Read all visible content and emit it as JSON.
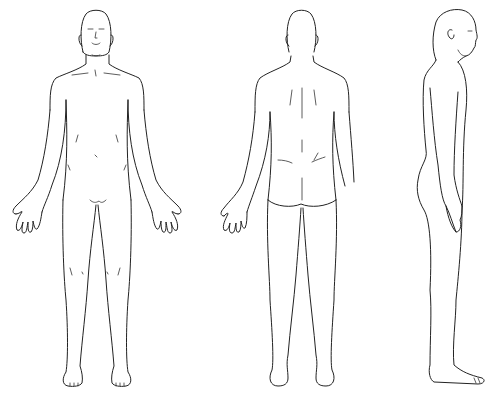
{
  "diagram": {
    "type": "body-outline-chart",
    "background": "#ffffff",
    "stroke_color": "#222222",
    "views": [
      {
        "id": "front",
        "label": ""
      },
      {
        "id": "back",
        "label": ""
      },
      {
        "id": "side",
        "label": ""
      }
    ]
  }
}
